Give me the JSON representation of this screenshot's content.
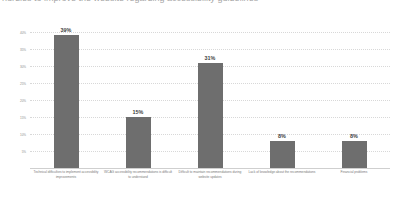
{
  "title": {
    "text": "hurdles to improve the website regarding accessibility guidelines",
    "note": "clipped by top edge of screenshot"
  },
  "chart_data": {
    "type": "bar",
    "title": "",
    "xlabel": "",
    "ylabel": "",
    "ylim": [
      0,
      40
    ],
    "grid": true,
    "legend": null,
    "orientation": "vertical",
    "bar_color": "#6e6e6e",
    "background_color": "#ffffff",
    "gridline_color": "#d8d8d8",
    "categories": [
      "Technical difficulties to implement accessibility improvements",
      "WCAG accessibility recommendations is difficult to understand",
      "Difficult to maintain recommendations during website updates",
      "Lack of knowledge about the recommendations",
      "Financial problems"
    ],
    "values": [
      39,
      15,
      31,
      8,
      8
    ],
    "data_labels": [
      "39%",
      "15%",
      "31%",
      "8%",
      "8%"
    ],
    "yticks": [
      5,
      10,
      15,
      20,
      25,
      30,
      35,
      40
    ],
    "ytick_labels": [
      "5%",
      "10%",
      "15%",
      "20%",
      "25%",
      "30%",
      "35%",
      "40%"
    ]
  }
}
